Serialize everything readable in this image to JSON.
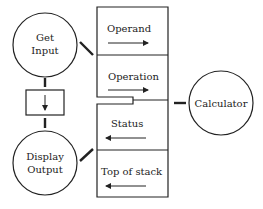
{
  "diagram": {
    "nodes": {
      "get_input": {
        "line1": "Get",
        "line2": "Input"
      },
      "display_output": {
        "line1": "Display",
        "line2": "Output"
      },
      "calculator": {
        "label": "Calculator"
      }
    },
    "interface": {
      "fields": [
        {
          "label": "Operand",
          "arrow": "right"
        },
        {
          "label": "Operation",
          "arrow": "right"
        },
        {
          "label": "Status",
          "arrow": "left"
        },
        {
          "label": "Top of stack",
          "arrow": "left"
        }
      ]
    },
    "colors": {
      "stroke": "#222222",
      "background": "#ffffff"
    }
  }
}
